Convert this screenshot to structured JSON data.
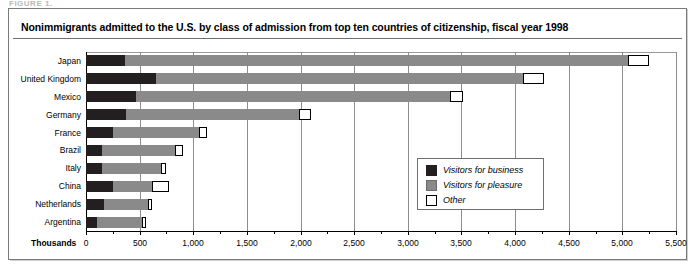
{
  "figure_tag": "FIGURE 1.",
  "title": "Nonimmigrants admitted to the U.S. by class of admission from top ten countries of citizenship, fiscal year 1998",
  "units_label": "Thousands",
  "legend": {
    "items": [
      {
        "key": "business",
        "label": "Visitors for business",
        "color": "#231f20"
      },
      {
        "key": "pleasure",
        "label": "Visitors for pleasure",
        "color": "#8a8a8a"
      },
      {
        "key": "other",
        "label": "Other",
        "color": "#ffffff"
      }
    ]
  },
  "chart_data": {
    "type": "bar",
    "orientation": "horizontal",
    "stacked": true,
    "title": "Nonimmigrants admitted to the U.S. by class of admission from top ten countries of citizenship, fiscal year 1998",
    "xlabel": "Thousands",
    "ylabel": "",
    "xlim": [
      0,
      5500
    ],
    "xticks": [
      0,
      500,
      1000,
      1500,
      2000,
      2500,
      3000,
      3500,
      4000,
      4500,
      5000,
      5500
    ],
    "xtick_labels": [
      "0",
      "500",
      "1,000",
      "1,500",
      "2,000",
      "2,500",
      "3,000",
      "3,500",
      "4,000",
      "4,500",
      "5,000",
      "5,500"
    ],
    "grid": true,
    "legend_position": "center-right inside plot",
    "categories": [
      "Japan",
      "United Kingdom",
      "Mexico",
      "Germany",
      "France",
      "Brazil",
      "Italy",
      "China",
      "Netherlands",
      "Argentina"
    ],
    "series": [
      {
        "name": "Visitors for business",
        "color": "#231f20",
        "values": [
          360,
          650,
          465,
          370,
          255,
          150,
          150,
          255,
          170,
          105
        ]
      },
      {
        "name": "Visitors for pleasure",
        "color": "#8a8a8a",
        "values": [
          4690,
          3420,
          2925,
          1620,
          795,
          680,
          550,
          360,
          405,
          415
        ]
      },
      {
        "name": "Other",
        "color": "#ffffff",
        "values": [
          200,
          200,
          120,
          110,
          80,
          70,
          50,
          160,
          40,
          40
        ]
      }
    ],
    "totals": [
      5250,
      4270,
      3510,
      2100,
      1130,
      900,
      750,
      775,
      615,
      560
    ]
  }
}
